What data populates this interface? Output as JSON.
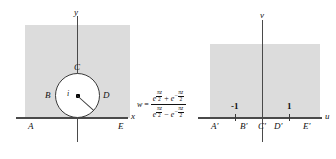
{
  "figure": {
    "type": "conformal-mapping-diagram",
    "colors": {
      "shade": "#dcdcdc",
      "line": "#4a4a4a",
      "text": "#111111",
      "circle_fill": "#ffffff"
    }
  },
  "z_plane": {
    "axis_x_label": "x",
    "axis_y_label": "y",
    "boundary_labels": {
      "A": "A",
      "B": "B",
      "C": "C",
      "D": "D",
      "E": "E"
    },
    "center_label": "i",
    "circle": {
      "center": [
        0,
        1
      ],
      "radius": 1
    }
  },
  "w_plane": {
    "axis_u_label": "u",
    "axis_v_label": "v",
    "boundary_labels": {
      "A": "A'",
      "B": "B'",
      "C": "C'",
      "D": "D'",
      "E": "E'"
    },
    "tick_labels": {
      "left": "-1",
      "right": "1"
    },
    "tick_values": [
      -1,
      1
    ]
  },
  "mapping": {
    "lhs": "w",
    "equals": "=",
    "numerator": {
      "term1_base": "e",
      "term1_exp_sym": "πz",
      "term1_exp_den": "2",
      "operator": "+",
      "term2_base": "e",
      "term2_exp_sign": "−",
      "term2_exp_sym": "πz",
      "term2_exp_den": "2"
    },
    "denominator": {
      "term1_base": "e",
      "term1_exp_sym": "πz",
      "term1_exp_den": "2",
      "operator": "−",
      "term2_base": "e",
      "term2_exp_sign": "−",
      "term2_exp_sym": "πz",
      "term2_exp_den": "2"
    },
    "plain_text": "w = (e^(πz/2) + e^(-πz/2)) / (e^(πz/2) - e^(-πz/2))"
  }
}
